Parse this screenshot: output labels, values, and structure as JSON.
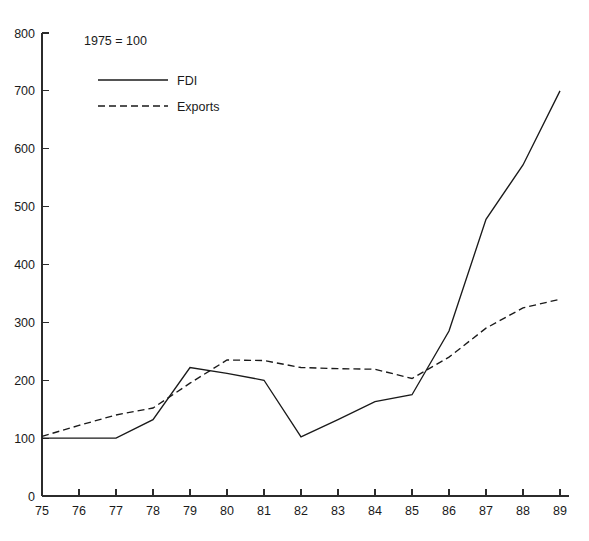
{
  "chart_data": {
    "type": "line",
    "title": "",
    "subtitle": "",
    "annotation": "1975 = 100",
    "xlabel": "",
    "ylabel": "",
    "x": [
      "75",
      "76",
      "77",
      "78",
      "79",
      "80",
      "81",
      "82",
      "83",
      "84",
      "85",
      "86",
      "87",
      "88",
      "89"
    ],
    "xtick_labels": [
      "75",
      "76",
      "77",
      "78",
      "79",
      "80",
      "81",
      "82",
      "83",
      "84",
      "85",
      "86",
      "87",
      "88",
      "89"
    ],
    "ytick_labels": [
      "0",
      "100",
      "200",
      "300",
      "400",
      "500",
      "600",
      "700",
      "800"
    ],
    "ytick_values": [
      0,
      100,
      200,
      300,
      400,
      500,
      600,
      700,
      800
    ],
    "ylim": [
      0,
      800
    ],
    "xlim": [
      "75",
      "89"
    ],
    "grid": false,
    "legend_position": "top-left",
    "series": [
      {
        "name": "FDI",
        "style": "solid",
        "color": "#1a1a1a",
        "values": [
          100,
          100,
          100,
          132,
          222,
          212,
          200,
          102,
          132,
          163,
          175,
          285,
          478,
          572,
          700
        ]
      },
      {
        "name": "Exports",
        "style": "dashed",
        "color": "#1a1a1a",
        "values": [
          103,
          122,
          140,
          152,
          195,
          235,
          234,
          222,
          220,
          219,
          203,
          240,
          290,
          325,
          340
        ]
      }
    ]
  },
  "legend": {
    "items": [
      {
        "label": "FDI",
        "style": "solid"
      },
      {
        "label": "Exports",
        "style": "dashed"
      }
    ]
  },
  "annotation": {
    "base_note": "1975 = 100"
  }
}
